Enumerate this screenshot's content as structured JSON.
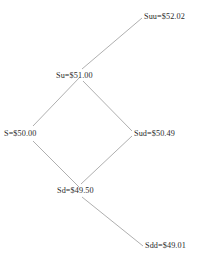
{
  "diagram": {
    "type": "binomial-tree",
    "background_color": "#ffffff",
    "edge_color": "#8d8d8d",
    "text_color": "#2b2b2b",
    "width": 204,
    "height": 264,
    "nodes": [
      {
        "id": "S",
        "label": "S=$50.00",
        "value": 50.0,
        "step": 0,
        "x": 34,
        "y": 133,
        "label_x": 4,
        "label_y": 129
      },
      {
        "id": "Su",
        "label": "Su=$51.00",
        "value": 51.0,
        "step": 1,
        "x": 81,
        "y": 75,
        "label_x": 56,
        "label_y": 71
      },
      {
        "id": "Sd",
        "label": "Sd=$49.50",
        "value": 49.5,
        "step": 1,
        "x": 81,
        "y": 190,
        "label_x": 57,
        "label_y": 186
      },
      {
        "id": "Suu",
        "label": "Suu=$52.02",
        "value": 52.02,
        "step": 2,
        "x": 142,
        "y": 18,
        "label_x": 144,
        "label_y": 12
      },
      {
        "id": "Sud",
        "label": "Sud=$50.49",
        "value": 50.49,
        "step": 2,
        "x": 132,
        "y": 133,
        "label_x": 134,
        "label_y": 129
      },
      {
        "id": "Sdd",
        "label": "Sdd=$49.01",
        "value": 49.01,
        "step": 2,
        "x": 143,
        "y": 246,
        "label_x": 145,
        "label_y": 241
      }
    ],
    "edges": [
      {
        "id": "S-Su",
        "from": "S",
        "to": "Su",
        "x1": 33,
        "y1": 126,
        "x2": 80,
        "y2": 77,
        "direction": "up"
      },
      {
        "id": "S-Sd",
        "from": "S",
        "to": "Sd",
        "x1": 33,
        "y1": 141,
        "x2": 79,
        "y2": 187,
        "direction": "down"
      },
      {
        "id": "Su-Suu",
        "from": "Su",
        "to": "Suu",
        "x1": 82,
        "y1": 69,
        "x2": 142,
        "y2": 18,
        "direction": "up"
      },
      {
        "id": "Su-Sud",
        "from": "Su",
        "to": "Sud",
        "x1": 83,
        "y1": 81,
        "x2": 132,
        "y2": 131,
        "direction": "down"
      },
      {
        "id": "Sd-Sud",
        "from": "Sd",
        "to": "Sud",
        "x1": 81,
        "y1": 184,
        "x2": 132,
        "y2": 136,
        "direction": "up"
      },
      {
        "id": "Sd-Sdd",
        "from": "Sd",
        "to": "Sdd",
        "x1": 82,
        "y1": 197,
        "x2": 143,
        "y2": 246,
        "direction": "down"
      }
    ]
  }
}
